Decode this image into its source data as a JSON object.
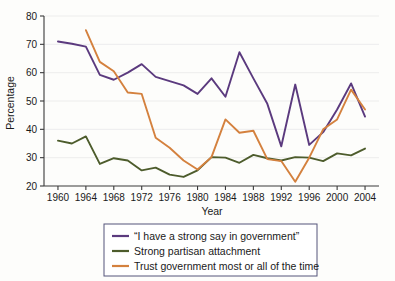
{
  "chart_data": {
    "type": "line",
    "title": "",
    "xlabel": "Year",
    "ylabel": "Percentage",
    "xlim": [
      1958,
      2006
    ],
    "ylim": [
      20,
      80
    ],
    "xticks": [
      1960,
      1964,
      1968,
      1972,
      1976,
      1980,
      1984,
      1988,
      1992,
      1996,
      2000,
      2004
    ],
    "yticks": [
      20,
      30,
      40,
      50,
      60,
      70,
      80
    ],
    "grid": "horizontal",
    "legend_position": "below-axes",
    "x": [
      1960,
      1962,
      1964,
      1966,
      1968,
      1970,
      1972,
      1974,
      1976,
      1978,
      1980,
      1982,
      1984,
      1986,
      1988,
      1990,
      1992,
      1994,
      1996,
      1998,
      2000,
      2002,
      2004
    ],
    "series": [
      {
        "name": "“I have a strong say in government”",
        "color": "#5b3a7e",
        "values": [
          71.0,
          70.2,
          69.2,
          59.2,
          57.5,
          60.0,
          63.0,
          58.5,
          57.0,
          55.5,
          52.5,
          58.0,
          51.5,
          67.2,
          58.0,
          49.0,
          34.0,
          55.8,
          34.5,
          39.0,
          47.0,
          56.2,
          44.5
        ]
      },
      {
        "name": "Strong partisan attachment",
        "color": "#4d5c2c",
        "values": [
          36.0,
          35.0,
          37.5,
          27.8,
          29.8,
          29.0,
          25.5,
          26.5,
          24.0,
          23.2,
          25.5,
          30.2,
          30.0,
          28.2,
          31.0,
          29.8,
          29.0,
          30.2,
          30.0,
          28.8,
          31.5,
          30.8,
          33.2
        ]
      },
      {
        "name": "Trust government most or all of the time",
        "color": "#d4813e",
        "values": [
          null,
          null,
          75.0,
          63.8,
          60.5,
          53.0,
          52.5,
          37.0,
          33.5,
          29.0,
          25.8,
          30.2,
          43.5,
          38.8,
          39.5,
          29.5,
          28.8,
          21.5,
          30.0,
          40.0,
          43.5,
          54.0,
          47.0
        ]
      }
    ]
  },
  "legend": {
    "items": [
      {
        "label": "“I have a strong say in government”",
        "color": "#5b3a7e"
      },
      {
        "label": "Strong partisan attachment",
        "color": "#4d5c2c"
      },
      {
        "label": "Trust government most or all of the time",
        "color": "#d4813e"
      }
    ]
  }
}
